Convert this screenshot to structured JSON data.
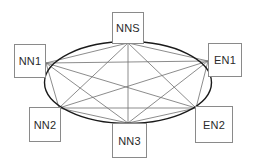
{
  "diagram": {
    "type": "full-mesh-network",
    "ring": {
      "cx": 128,
      "cy": 82.5,
      "rx": 83.5,
      "ry": 41,
      "stroke": "#1a1a1a"
    },
    "link_color": "#6e6e6e",
    "nodes": [
      {
        "id": "NNS",
        "label": "NNS",
        "box": {
          "x": 112,
          "y": 12,
          "w": 32,
          "h": 32
        },
        "anchor": [
          128,
          43
        ]
      },
      {
        "id": "NN1",
        "label": "NN1",
        "box": {
          "x": 14,
          "y": 44,
          "w": 32,
          "h": 34
        },
        "anchor": [
          46,
          63
        ]
      },
      {
        "id": "EN1",
        "label": "EN1",
        "box": {
          "x": 208,
          "y": 43,
          "w": 34,
          "h": 34
        },
        "anchor": [
          208,
          61
        ]
      },
      {
        "id": "NN2",
        "label": "NN2",
        "box": {
          "x": 29,
          "y": 107,
          "w": 32,
          "h": 35
        },
        "anchor": [
          59,
          108
        ]
      },
      {
        "id": "NN3",
        "label": "NN3",
        "box": {
          "x": 112,
          "y": 123,
          "w": 35,
          "h": 35
        },
        "anchor": [
          128,
          123
        ]
      },
      {
        "id": "EN2",
        "label": "EN2",
        "box": {
          "x": 195,
          "y": 106,
          "w": 38,
          "h": 37
        },
        "anchor": [
          196,
          108
        ]
      }
    ],
    "links": [
      [
        "NNS",
        "NN1"
      ],
      [
        "NNS",
        "EN1"
      ],
      [
        "NNS",
        "NN2"
      ],
      [
        "NNS",
        "NN3"
      ],
      [
        "NNS",
        "EN2"
      ],
      [
        "NN1",
        "EN1"
      ],
      [
        "NN1",
        "NN2"
      ],
      [
        "NN1",
        "NN3"
      ],
      [
        "NN1",
        "EN2"
      ],
      [
        "EN1",
        "NN2"
      ],
      [
        "EN1",
        "NN3"
      ],
      [
        "EN1",
        "EN2"
      ],
      [
        "NN2",
        "NN3"
      ],
      [
        "NN2",
        "EN2"
      ],
      [
        "NN3",
        "EN2"
      ]
    ]
  }
}
